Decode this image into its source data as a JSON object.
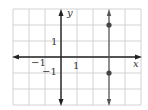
{
  "chart_data": {
    "type": "line",
    "title": "",
    "xlabel": "x",
    "ylabel": "y",
    "xlim": [
      -3,
      5
    ],
    "ylim": [
      -3,
      3
    ],
    "grid": true,
    "x_tick_labels": [
      {
        "value": -1,
        "label": "−1"
      },
      {
        "value": 1,
        "label": "1"
      }
    ],
    "y_tick_labels": [
      {
        "value": 1,
        "label": "1"
      },
      {
        "value": -1,
        "label": "−1"
      }
    ],
    "series": [
      {
        "name": "vertical line x = 3",
        "type": "vertical-line",
        "x": 3,
        "arrows": "both",
        "color": "#555555",
        "points": [
          {
            "x": 3,
            "y": 2
          },
          {
            "x": 3,
            "y": -1
          }
        ]
      }
    ],
    "colors": {
      "axes": "#222222",
      "grid": "#c8c8c8",
      "line": "#555555",
      "points": "#444444"
    }
  }
}
